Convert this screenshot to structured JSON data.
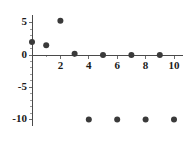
{
  "chart_data": {
    "type": "scatter",
    "title": "",
    "xlabel": "",
    "ylabel": "",
    "xlim": [
      -0.6,
      10.6
    ],
    "ylim": [
      -11.0,
      6.2
    ],
    "grid": false,
    "legend": null,
    "x_ticks": [
      2,
      4,
      6,
      8,
      10
    ],
    "x_tick_labels": [
      "2",
      "4",
      "6",
      "8",
      "10"
    ],
    "x_minor_ticks": [
      1,
      3,
      5,
      7,
      9
    ],
    "y_ticks": [
      5,
      0,
      -5,
      -10
    ],
    "y_tick_labels": [
      "5",
      "0",
      "-5",
      "-10"
    ],
    "y_minor_ticks": [
      4,
      3,
      2,
      1,
      -1,
      -2,
      -3,
      -4,
      -6,
      -7,
      -8,
      -9
    ],
    "marker": "circle",
    "marker_color": "#3a3a3a",
    "marker_size": 3,
    "points": [
      {
        "x": 0,
        "y": 2.0
      },
      {
        "x": 1,
        "y": 1.5
      },
      {
        "x": 2,
        "y": 5.3
      },
      {
        "x": 3,
        "y": 0.2
      },
      {
        "x": 4,
        "y": -10.0
      },
      {
        "x": 5,
        "y": 0.0
      },
      {
        "x": 6,
        "y": -10.0
      },
      {
        "x": 7,
        "y": 0.0
      },
      {
        "x": 8,
        "y": -10.0
      },
      {
        "x": 9,
        "y": 0.0
      },
      {
        "x": 10,
        "y": -10.0
      }
    ],
    "axis_color": "#4a4a4a",
    "background_color": "#ffffff"
  }
}
